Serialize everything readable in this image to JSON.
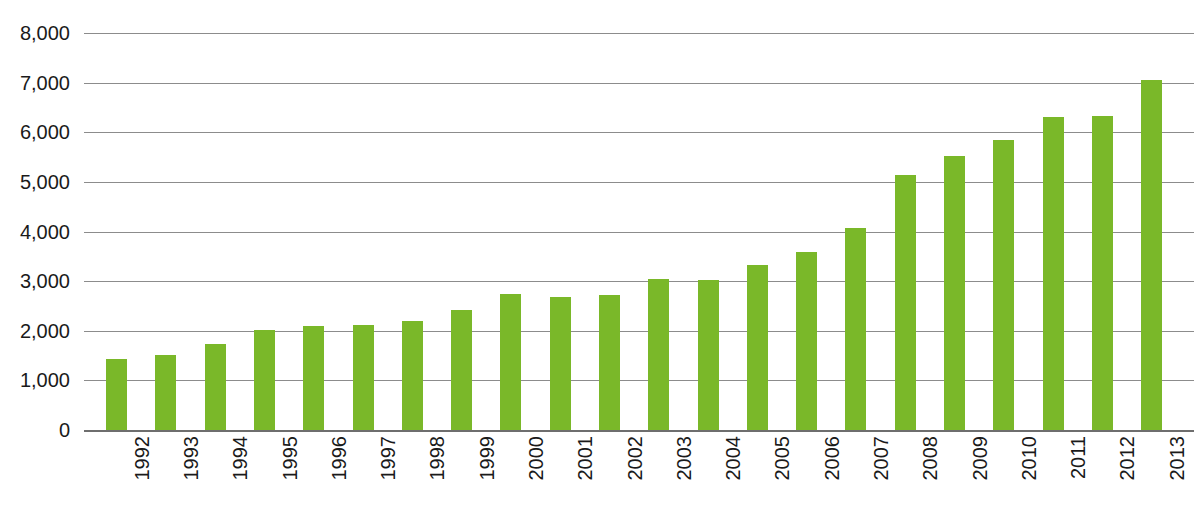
{
  "chart_data": {
    "type": "bar",
    "title": "",
    "subtitle": "",
    "xlabel": "",
    "ylabel": "",
    "categories": [
      "1992",
      "1993",
      "1994",
      "1995",
      "1996",
      "1997",
      "1998",
      "1999",
      "2000",
      "2001",
      "2002",
      "2003",
      "2004",
      "2005",
      "2006",
      "2007",
      "2008",
      "2009",
      "2010",
      "2011",
      "2012",
      "2013"
    ],
    "values": [
      1430,
      1510,
      1730,
      2010,
      2090,
      2120,
      2200,
      2420,
      2750,
      2690,
      2720,
      3040,
      3020,
      3320,
      3580,
      4070,
      5130,
      5530,
      5850,
      6310,
      6330,
      7060
    ],
    "series": [
      {
        "name": "",
        "values": [
          1430,
          1510,
          1730,
          2010,
          2090,
          2120,
          2200,
          2420,
          2750,
          2690,
          2720,
          3040,
          3020,
          3320,
          3580,
          4070,
          5130,
          5530,
          5850,
          6310,
          6330,
          7060
        ]
      }
    ],
    "ylim": [
      0,
      8000
    ],
    "ytick_values": [
      0,
      1000,
      2000,
      3000,
      4000,
      5000,
      6000,
      7000,
      8000
    ],
    "ytick_labels": [
      "0",
      "1,000",
      "2,000",
      "3,000",
      "4,000",
      "5,000",
      "6,000",
      "7,000",
      "8,000"
    ],
    "grid": true,
    "legend": "none",
    "bar_color": "#7ab829",
    "gridline_color": "#8c8c8c",
    "axis_color": "#6e6e6e",
    "background_color": "#ffffff",
    "xtick_rotation": -90
  },
  "figure": {
    "title_fragment": "",
    "caption_fragment": ""
  }
}
